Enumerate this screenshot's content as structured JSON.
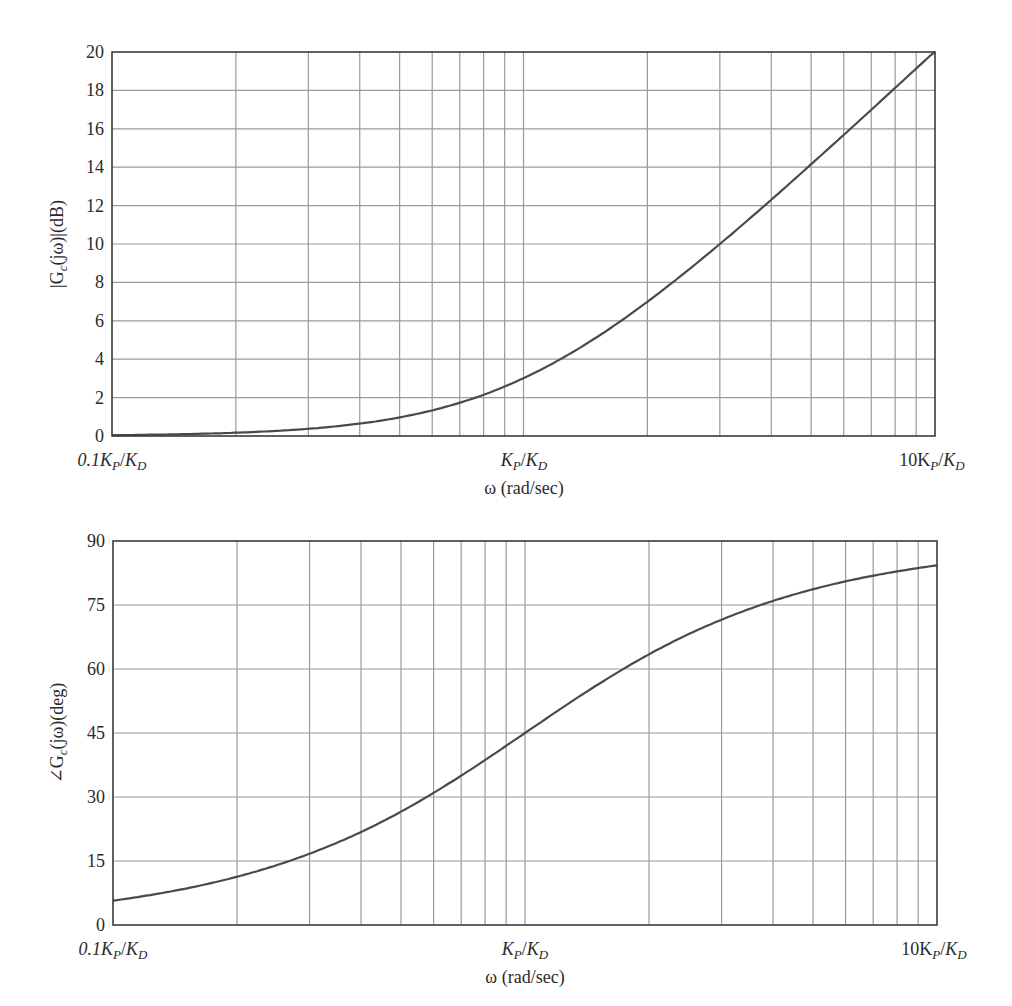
{
  "chart_data": [
    {
      "type": "line",
      "title": "",
      "xlabel": "ω (rad/sec)",
      "ylabel": "|Gc(jω)|(dB)",
      "xscale": "log",
      "xlim_normalized": [
        0.1,
        10
      ],
      "x_tick_labels": [
        "0.1Kp/KD",
        "Kp/KD",
        "10Kp/KD"
      ],
      "ylim": [
        0,
        20
      ],
      "y_ticks": [
        0,
        2,
        4,
        6,
        8,
        10,
        12,
        14,
        16,
        18,
        20
      ],
      "grid": true,
      "legend": null,
      "series": [
        {
          "name": "|Gc(jω)| dB",
          "x_normalized": [
            0.1,
            0.2,
            0.3,
            0.5,
            0.7,
            1,
            2,
            3,
            5,
            7,
            10
          ],
          "values": [
            0.04,
            0.17,
            0.37,
            0.97,
            1.73,
            3.01,
            6.99,
            10.0,
            14.15,
            16.99,
            20.04
          ]
        }
      ]
    },
    {
      "type": "line",
      "title": "",
      "xlabel": "ω (rad/sec)",
      "ylabel": "∠Gc(jω)(deg)",
      "xscale": "log",
      "xlim_normalized": [
        0.1,
        10
      ],
      "x_tick_labels": [
        "0.1Kp/KD",
        "Kp/KD",
        "10Kp/KD"
      ],
      "ylim": [
        0,
        90
      ],
      "y_ticks": [
        0,
        15,
        30,
        45,
        60,
        75,
        90
      ],
      "grid": true,
      "legend": null,
      "series": [
        {
          "name": "∠Gc(jω) deg",
          "x_normalized": [
            0.1,
            0.2,
            0.3,
            0.5,
            0.7,
            1,
            2,
            3,
            5,
            7,
            10
          ],
          "values": [
            5.7,
            11.3,
            16.7,
            26.6,
            35.0,
            45.0,
            63.4,
            71.6,
            78.7,
            81.9,
            84.3
          ]
        }
      ]
    }
  ],
  "plots": {
    "magnitude": {
      "ylabel_prefix": "|G",
      "ylabel_sub": "c",
      "ylabel_suffix": "(jω)|(dB)",
      "y_tick_labels": [
        "0",
        "2",
        "4",
        "6",
        "8",
        "10",
        "12",
        "14",
        "16",
        "18",
        "20"
      ],
      "x_label": "ω (rad/sec)",
      "x_tick_left": "0.1K",
      "x_tick_mid": "K",
      "x_tick_right": "10K"
    },
    "phase": {
      "ylabel_prefix": "∠G",
      "ylabel_sub": "c",
      "ylabel_suffix": "(jω)(deg)",
      "y_tick_labels": [
        "0",
        "15",
        "30",
        "45",
        "60",
        "75",
        "90"
      ],
      "x_label": "ω (rad/sec)",
      "x_tick_left": "0.1K",
      "x_tick_mid": "K",
      "x_tick_right": "10K"
    },
    "subscripts": {
      "p": "P",
      "d": "D"
    },
    "slash": "/"
  },
  "colors": {
    "curve": "#4a4a4a",
    "grid": "#9a9a9a",
    "frame": "#3a3a3a",
    "text": "#2a2a2a"
  }
}
